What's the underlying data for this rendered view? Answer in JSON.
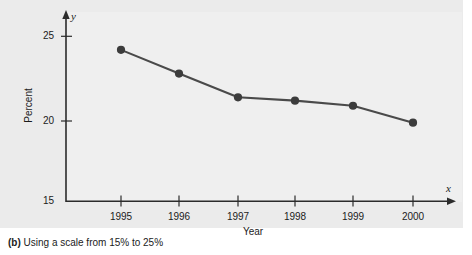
{
  "chart_data": {
    "type": "line",
    "title": "",
    "subtitle": "",
    "xlabel": "Year",
    "ylabel": "Percent",
    "x_axis_letter": "x",
    "y_axis_letter": "y",
    "categories": [
      "1995",
      "1996",
      "1997",
      "1998",
      "1999",
      "2000"
    ],
    "values": [
      24.2,
      22.8,
      21.4,
      21.2,
      20.9,
      19.9
    ],
    "series": [
      {
        "name": "Percent",
        "values": [
          24.2,
          22.8,
          21.4,
          21.2,
          20.9,
          19.9
        ]
      }
    ],
    "ylim": [
      15,
      25
    ],
    "yticks": [
      "15",
      "20",
      "25"
    ],
    "ytick_values": [
      15,
      20,
      25
    ],
    "xtick_labels": [
      "1995",
      "1996",
      "1997",
      "1998",
      "1999",
      "2000"
    ],
    "grid": false,
    "legend": "none",
    "marker": "filled-circle",
    "line_color": "#4a4a4a",
    "marker_color": "#3c3c3c",
    "axis_color": "#2b2b2b",
    "panel_color": "#ebebeb",
    "text_color": "#1b1b1b"
  },
  "caption": {
    "label": "(b)",
    "text": " Using a scale from 15% to 25%"
  }
}
